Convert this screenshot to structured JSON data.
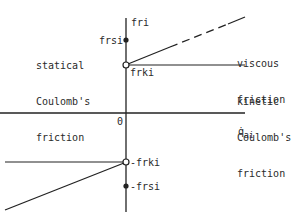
{
  "diagram": {
    "type": "friction-characteristic",
    "axes": {
      "vertical_label": "fri",
      "horizontal_label": "q̇",
      "horizontal_label_sub": "ai",
      "origin_label": "0"
    },
    "points": {
      "frsi": "frsi",
      "frki": "frki",
      "neg_frki": "-frki",
      "neg_frsi": "-frsi"
    },
    "annotations": {
      "statical_line1": "statical",
      "statical_line2": "Coulomb's",
      "statical_line3": "friction",
      "viscous_line1": "viscous",
      "viscous_line2": "friction",
      "kinetic_line1": "kinetic",
      "kinetic_line2": "Coulomb's",
      "kinetic_line3": "friction"
    },
    "colors": {
      "line": "#222222",
      "background": "#ffffff"
    }
  }
}
